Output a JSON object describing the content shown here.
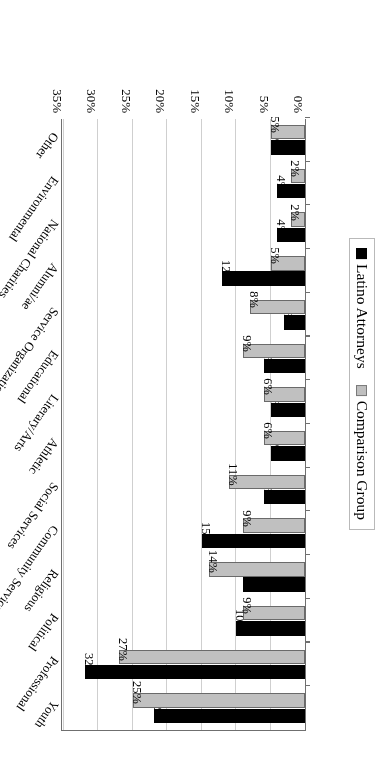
{
  "chart_data": {
    "type": "bar",
    "orientation": "horizontal",
    "title": "",
    "xlabel": "",
    "ylabel": "Percentage of Participants",
    "ylim": [
      0,
      35
    ],
    "ytick_labels": [
      "0%",
      "5%",
      "10%",
      "15%",
      "20%",
      "25%",
      "30%",
      "35%"
    ],
    "ytick_values": [
      0,
      5,
      10,
      15,
      20,
      25,
      30,
      35
    ],
    "grid": true,
    "legend_position": "top-left",
    "categories": [
      "Youth",
      "Professional",
      "Political",
      "Religious",
      "Community Service",
      "Social Services",
      "Athletic",
      "Literary/Arts",
      "Educational",
      "Service Organizations",
      "Alumni/ae",
      "National Charities",
      "Environmental",
      "Other"
    ],
    "series": [
      {
        "name": "Latino Attorneys",
        "color": "#000000",
        "values": [
          22,
          32,
          10,
          9,
          15,
          6,
          5,
          5,
          6,
          3,
          12,
          4,
          4,
          5
        ],
        "labels": [
          "22%",
          "32%",
          "10%",
          "9%",
          "15%",
          "6%",
          "5%",
          "5%",
          "6%",
          "3%",
          "12%",
          "4%",
          "4%",
          "5%"
        ]
      },
      {
        "name": "Comparison Group",
        "color": "#c0c0c0",
        "values": [
          25,
          27,
          9,
          14,
          9,
          11,
          6,
          6,
          9,
          8,
          5,
          2,
          2,
          5
        ],
        "labels": [
          "25%",
          "27%",
          "9%",
          "14%",
          "9%",
          "11%",
          "6%",
          "6%",
          "9%",
          "8%",
          "5%",
          "2%",
          "2%",
          "5%"
        ]
      }
    ]
  },
  "legend": {
    "items": [
      {
        "label": "Latino Attorneys",
        "swatch": "dark"
      },
      {
        "label": "Comparison Group",
        "swatch": "light"
      }
    ]
  },
  "axis": {
    "value_axis_title": "Percentage of Participants"
  }
}
